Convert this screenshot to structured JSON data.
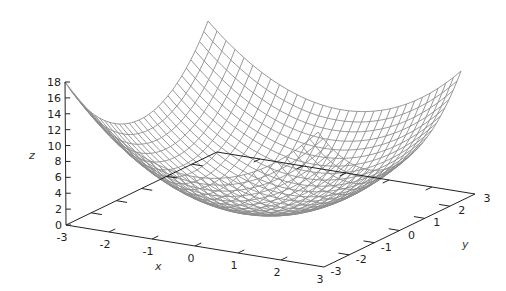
{
  "chart_data": {
    "type": "surface",
    "title": "",
    "function": "z = x^2 + y^2",
    "xlabel": "x",
    "ylabel": "y",
    "zlabel": "z",
    "xlim": [
      -3,
      3
    ],
    "ylim": [
      -3,
      3
    ],
    "zlim": [
      0,
      18
    ],
    "x_ticks": [
      "-3",
      "-2",
      "-1",
      "0",
      "1",
      "2",
      "3"
    ],
    "y_ticks": [
      "-3",
      "-2",
      "-1",
      "0",
      "1",
      "2",
      "3"
    ],
    "z_ticks": [
      "0",
      "2",
      "4",
      "6",
      "8",
      "10",
      "12",
      "14",
      "16",
      "18"
    ],
    "mesh_samples": 31,
    "mesh_color": "#8c8c8c",
    "axis_color": "#222222",
    "grid": false,
    "legend": "none"
  }
}
